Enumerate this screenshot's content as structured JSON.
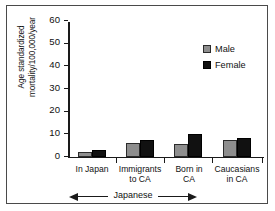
{
  "chart_data": {
    "type": "bar",
    "title": "",
    "xlabel": "",
    "ylabel": "Age standardized mortality/100,000/year",
    "ylabel_line1": "Age standardized",
    "ylabel_line2": "mortality/100,000/year",
    "categories": [
      "In Japan",
      "Immigrants to CA",
      "Born in CA",
      "Caucasians in CA"
    ],
    "category_lines": [
      [
        "In Japan",
        ""
      ],
      [
        "Immigrants",
        "to CA"
      ],
      [
        "Born in",
        "CA"
      ],
      [
        "Caucasians",
        "in CA"
      ]
    ],
    "series": [
      {
        "name": "Male",
        "color": "#8e8e8e",
        "values": [
          2,
          6,
          5.5,
          7.5
        ]
      },
      {
        "name": "Female",
        "color": "#111111",
        "values": [
          3,
          7.5,
          10,
          8.5
        ]
      }
    ],
    "ylim": [
      0,
      60
    ],
    "yticks": [
      0,
      10,
      20,
      30,
      40,
      50,
      60
    ],
    "ytick_labels": [
      "0",
      "10",
      "20",
      "30",
      "40",
      "50",
      "60"
    ],
    "grid": false,
    "legend_position": "top-right",
    "legend_entries": [
      "Male",
      "Female"
    ],
    "annotations": [
      {
        "text": "Japanese",
        "style": "double-headed-arrow",
        "spans_categories": [
          "In Japan",
          "Immigrants to CA",
          "Born in CA"
        ]
      }
    ]
  },
  "legend": {
    "male_label": "Male",
    "female_label": "Female"
  },
  "axis": {
    "y_label_line1": "Age standardized",
    "y_label_line2": "mortality/100,000/year",
    "tick_60": "60",
    "tick_50": "50",
    "tick_40": "40",
    "tick_30": "30",
    "tick_20": "20",
    "tick_10": "10",
    "tick_0": "0"
  },
  "categories": {
    "c0_line1": "In Japan",
    "c0_line2": "",
    "c1_line1": "Immigrants",
    "c1_line2": "to CA",
    "c2_line1": "Born in",
    "c2_line2": "CA",
    "c3_line1": "Caucasians",
    "c3_line2": "in CA"
  },
  "annotation": {
    "japanese_label": "Japanese"
  }
}
